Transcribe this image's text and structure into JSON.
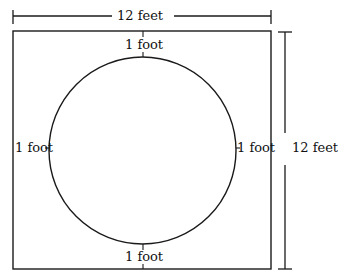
{
  "diagram": {
    "square_width_label": "12 feet",
    "square_height_label": "12 feet",
    "gap_top_label": "1 foot",
    "gap_bottom_label": "1 foot",
    "gap_left_label": "1 foot",
    "gap_right_label": "1 foot",
    "colors": {
      "line": "#1a1a1a",
      "background": "#ffffff"
    }
  }
}
